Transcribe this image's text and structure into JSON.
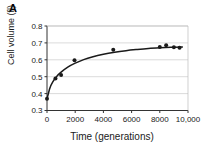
{
  "figure": {
    "panel_label": "A"
  },
  "chart_data": {
    "type": "scatter",
    "title": "",
    "xlabel": "Time (generations)",
    "ylabel": "Cell volume (fl)",
    "xlim": [
      0,
      10000
    ],
    "ylim": [
      0.3,
      0.8
    ],
    "grid": true,
    "grid_axis": "y",
    "legend": "none",
    "xticks": [
      0,
      2000,
      4000,
      6000,
      8000,
      10000
    ],
    "xtick_labels": [
      "0",
      "2000",
      "4000",
      "6000",
      "8000",
      "10,000"
    ],
    "yticks": [
      0.3,
      0.4,
      0.5,
      0.6,
      0.7,
      0.8
    ],
    "ytick_labels": [
      "0.3",
      "0.4",
      "0.5",
      "0.6",
      "0.7",
      "0.8"
    ],
    "marker_color": "#1a1a1a",
    "line_color": "#1a1a1a",
    "points": [
      {
        "x": 0,
        "y": 0.37
      },
      {
        "x": 600,
        "y": 0.49
      },
      {
        "x": 1000,
        "y": 0.51
      },
      {
        "x": 1950,
        "y": 0.597
      },
      {
        "x": 4700,
        "y": 0.66
      },
      {
        "x": 8000,
        "y": 0.675
      },
      {
        "x": 8450,
        "y": 0.686
      },
      {
        "x": 9000,
        "y": 0.674
      },
      {
        "x": 9400,
        "y": 0.672
      }
    ],
    "fit_curve": {
      "description": "saturating hyperbolic fit",
      "points": [
        {
          "x": 0,
          "y": 0.368
        },
        {
          "x": 200,
          "y": 0.432
        },
        {
          "x": 400,
          "y": 0.468
        },
        {
          "x": 700,
          "y": 0.503
        },
        {
          "x": 1000,
          "y": 0.527
        },
        {
          "x": 1500,
          "y": 0.558
        },
        {
          "x": 2000,
          "y": 0.58
        },
        {
          "x": 2600,
          "y": 0.601
        },
        {
          "x": 3200,
          "y": 0.617
        },
        {
          "x": 4000,
          "y": 0.633
        },
        {
          "x": 4800,
          "y": 0.645
        },
        {
          "x": 5600,
          "y": 0.654
        },
        {
          "x": 6400,
          "y": 0.661
        },
        {
          "x": 7200,
          "y": 0.667
        },
        {
          "x": 8000,
          "y": 0.671
        },
        {
          "x": 8800,
          "y": 0.674
        },
        {
          "x": 9600,
          "y": 0.676
        }
      ]
    }
  }
}
